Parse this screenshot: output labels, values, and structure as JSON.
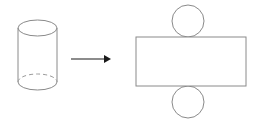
{
  "figure": {
    "background_color": "#ffffff",
    "width": 261,
    "height": 122,
    "left_shape": {
      "name": "cylinder",
      "label": "",
      "stroke_color": "#8a8a8a",
      "fill_color": "#ffffff",
      "top_ellipse": {
        "cx": 37.5,
        "cy": 28,
        "rx": 19.5,
        "ry": 8,
        "style": "solid"
      },
      "bottom_ellipse": {
        "cx": 37.5,
        "cy": 82,
        "rx": 19.5,
        "ry": 8,
        "hidden_arc_style": "dashed",
        "visible_arc_style": "solid"
      },
      "side_left": {
        "x": 18,
        "y1": 28,
        "y2": 82
      },
      "side_right": {
        "x": 57,
        "y1": 28,
        "y2": 82
      }
    },
    "arrow": {
      "name": "transformation-arrow",
      "label": "",
      "color": "#1a1a1a",
      "x1": 71,
      "x2": 111,
      "y": 59,
      "head_style": "filled-triangle"
    },
    "right_shape": {
      "name": "cylinder-net",
      "label": "",
      "stroke_color": "#8a8a8a",
      "fill_color": "#ffffff",
      "rectangle": {
        "x": 136,
        "y": 37,
        "width": 110,
        "height": 49
      },
      "top_circle": {
        "cx": 188,
        "cy": 21,
        "r": 16
      },
      "bottom_circle": {
        "cx": 188,
        "cy": 102,
        "r": 16
      }
    }
  }
}
